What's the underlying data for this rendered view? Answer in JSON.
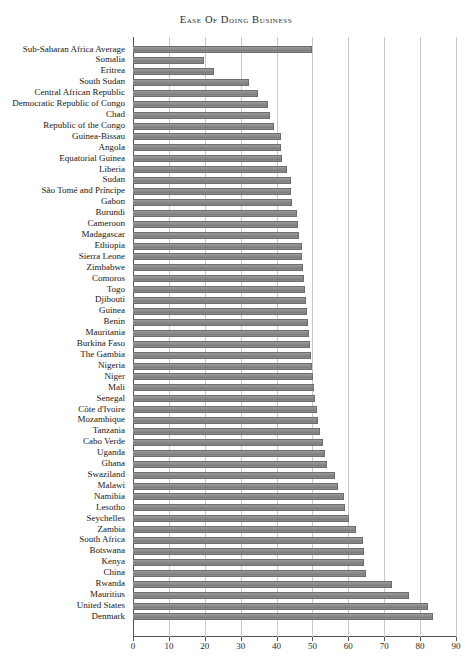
{
  "chart_data": {
    "type": "bar",
    "orientation": "horizontal",
    "title": "Ease of Doing Business",
    "xlabel": "",
    "ylabel": "",
    "xlim": [
      0,
      90
    ],
    "xticks": [
      0,
      10,
      20,
      30,
      40,
      50,
      60,
      70,
      80,
      90
    ],
    "grid": true,
    "legend": null,
    "bar_color": "#8a8a8a",
    "categories": [
      "Sub-Saharan Africa Average",
      "Somalia",
      "Eritrea",
      "South Sudan",
      "Central African Republic",
      "Democratic Republic of Congo",
      "Chad",
      "Republic of the Congo",
      "Guinea-Bissau",
      "Angola",
      "Equatorial Guinea",
      "Liberia",
      "Sudan",
      "São Tomé and Príncipe",
      "Gabon",
      "Burundi",
      "Cameroon",
      "Madagascar",
      "Ethiopia",
      "Sierra Leone",
      "Zimbabwe",
      "Comoros",
      "Togo",
      "Djibouti",
      "Guinea",
      "Benin",
      "Mauritania",
      "Burkina Faso",
      "The Gambia",
      "Nigeria",
      "Niger",
      "Mali",
      "Senegal",
      "Côte d'Ivoire",
      "Mozambique",
      "Tanzania",
      "Cabo Verde",
      "Uganda",
      "Ghana",
      "Swaziland",
      "Malawi",
      "Namibia",
      "Lesotho",
      "Seychelles",
      "Zambia",
      "South Africa",
      "Botswana",
      "Kenya",
      "China",
      "Rwanda",
      "Mauritius",
      "United States",
      "Denmark"
    ],
    "values": [
      49.9,
      19.9,
      22.6,
      32.2,
      34.9,
      37.7,
      38.2,
      39.4,
      41.2,
      41.2,
      41.4,
      43.0,
      43.9,
      44.0,
      44.4,
      45.6,
      46.0,
      46.2,
      47.0,
      47.2,
      47.4,
      47.6,
      47.9,
      48.1,
      48.4,
      48.8,
      49.0,
      49.3,
      49.5,
      50.0,
      50.2,
      50.4,
      50.7,
      51.2,
      51.6,
      52.0,
      53.0,
      53.6,
      54.0,
      56.2,
      57.1,
      58.8,
      59.2,
      60.3,
      62.0,
      64.0,
      64.3,
      64.5,
      65.0,
      72.1,
      77.0,
      82.2,
      83.7
    ]
  },
  "axis": {
    "tick_labels": [
      "0",
      "10",
      "20",
      "30",
      "40",
      "50",
      "60",
      "70",
      "80",
      "90"
    ]
  }
}
